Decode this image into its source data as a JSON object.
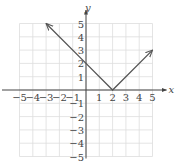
{
  "chart_data": {
    "type": "line",
    "title": "",
    "function": "y = |x - 2|",
    "xlabel": "x",
    "ylabel": "y",
    "xlim": [
      -5,
      5
    ],
    "ylim": [
      -5,
      5
    ],
    "grid": true,
    "x_ticks": [
      -5,
      -4,
      -3,
      -2,
      -1,
      1,
      2,
      3,
      4,
      5
    ],
    "y_ticks": [
      5,
      4,
      3,
      2,
      1,
      -1,
      -2,
      -3,
      -4,
      -5
    ],
    "series": [
      {
        "name": "y = |x - 2|",
        "x": [
          -3,
          0,
          2,
          5
        ],
        "y": [
          5,
          2,
          0,
          3
        ],
        "arrows": [
          "start",
          "end"
        ],
        "vertex": [
          2,
          0
        ]
      }
    ],
    "colors": {
      "curve": "#555555",
      "axis": "#444444",
      "grid": "#dddddd"
    }
  }
}
